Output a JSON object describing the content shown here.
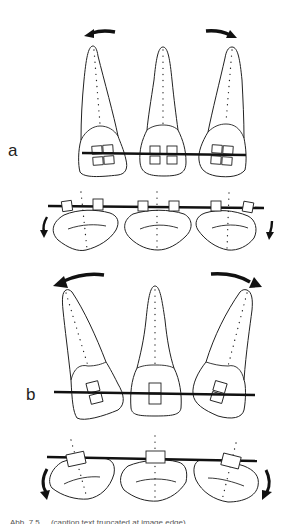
{
  "figure": {
    "panels": [
      {
        "label": "a",
        "description": "Frontal view: three incisors tipped outward with paired brackets on a straight archwire; rotation arrows above outer teeth",
        "occlusal_description": "Occlusal view: three crowns with two brackets each on archwire; downward arrows at outer ends"
      },
      {
        "label": "b",
        "description": "Frontal view: outer incisors tipped more strongly with single brackets; larger rotation arrows",
        "occlusal_description": "Occlusal view: single bracket per crown on archwire; curved arrows at outer ends"
      }
    ],
    "caption": "Abb. 7.5 ... (caption text truncated at image edge)",
    "colors": {
      "line": "#222222",
      "wire": "#111111",
      "background": "#ffffff"
    }
  }
}
